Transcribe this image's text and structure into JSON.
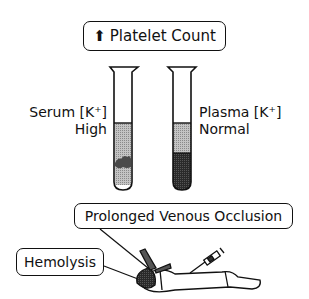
{
  "title_box": {
    "arrow": "up-arrow",
    "label": "Platelet Count"
  },
  "tubes": [
    {
      "label_line1": "Serum [K⁺]",
      "label_line2": "High",
      "side": "left"
    },
    {
      "label_line1": "Plasma [K⁺]",
      "label_line2": "Normal",
      "side": "right"
    }
  ],
  "callouts": {
    "occlusion": "Prolonged Venous Occlusion",
    "hemolysis": "Hemolysis"
  },
  "colors": {
    "ink": "#111111",
    "light_fill": "#b8b8b8",
    "dark_fill": "#2a2a2a",
    "clot": "#555555"
  }
}
